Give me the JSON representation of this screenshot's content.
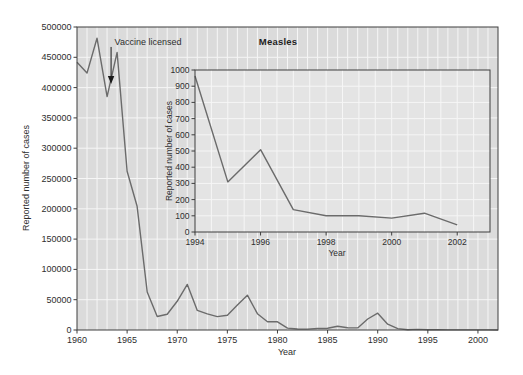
{
  "colors": {
    "figure_bg": "#ffffff",
    "main_plot_bg": "#dbdbdb",
    "inset_plot_bg": "#e4e4e4",
    "grid": "#f6f6f6",
    "line": "#6b6b6b",
    "border": "#3f3f3f",
    "tick_text": "#2e2e2e",
    "annotation_arrow": "#1a1a1a"
  },
  "chart_data": [
    {
      "type": "line",
      "title": "Measles",
      "xlabel": "Year",
      "ylabel": "Reported number of cases",
      "xlim": [
        1960,
        2002
      ],
      "ylim": [
        0,
        500000
      ],
      "xticks": [
        1960,
        1965,
        1970,
        1975,
        1980,
        1985,
        1990,
        1995,
        2000
      ],
      "yticks": [
        0,
        50000,
        100000,
        150000,
        200000,
        250000,
        300000,
        350000,
        400000,
        450000,
        500000
      ],
      "grid": {
        "x_step": 1,
        "y_step": 50000
      },
      "legend": "none",
      "annotation": {
        "text": "Vaccine licensed",
        "arrow_x": 1963.4,
        "arrow_tip_y": 406000
      },
      "x": [
        1960,
        1961,
        1962,
        1963,
        1964,
        1965,
        1966,
        1967,
        1968,
        1969,
        1970,
        1971,
        1972,
        1973,
        1974,
        1975,
        1976,
        1977,
        1978,
        1979,
        1980,
        1981,
        1982,
        1983,
        1984,
        1985,
        1986,
        1987,
        1988,
        1989,
        1990,
        1991,
        1992,
        1993,
        1994,
        1995,
        1996,
        1997,
        1998,
        1999,
        2000,
        2001,
        2002
      ],
      "y": [
        441703,
        423919,
        481530,
        385156,
        458083,
        261904,
        204136,
        62705,
        22231,
        25826,
        47351,
        75290,
        32275,
        26690,
        22094,
        24374,
        41126,
        57345,
        26871,
        13597,
        13506,
        3124,
        1714,
        1497,
        2587,
        2822,
        6282,
        3655,
        3396,
        18193,
        27786,
        9643,
        2237,
        312,
        963,
        309,
        508,
        138,
        100,
        100,
        86,
        116,
        44
      ]
    },
    {
      "type": "line",
      "title": "",
      "xlabel": "Year",
      "ylabel": "Reported number of cases",
      "xlim": [
        1994,
        2003
      ],
      "ylim": [
        0,
        1000
      ],
      "xticks": [
        1994,
        1996,
        1998,
        2000,
        2002
      ],
      "yticks": [
        0,
        100,
        200,
        300,
        400,
        500,
        600,
        700,
        800,
        900,
        1000
      ],
      "grid": {
        "x_step": 0.5,
        "y_step": 100
      },
      "legend": "none",
      "x": [
        1994,
        1995,
        1996,
        1997,
        1998,
        1999,
        2000,
        2001,
        2002
      ],
      "y": [
        963,
        309,
        508,
        138,
        100,
        100,
        86,
        116,
        44
      ]
    }
  ]
}
